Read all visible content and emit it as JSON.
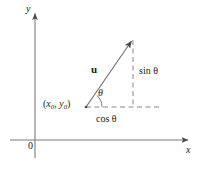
{
  "figure": {
    "colors": {
      "background": "#ffffff",
      "stroke": "#6b6b6b",
      "dashed": "#8a8a8a",
      "text": "#1a1a1a"
    },
    "axes": {
      "y_label": "y",
      "x_label": "x",
      "origin_label": "0"
    },
    "labels": {
      "vector": "u",
      "point_open": "(",
      "point_x": "x",
      "point_x_sub": "0",
      "point_comma": ", ",
      "point_y": "y",
      "point_y_sub": "0",
      "point_close": ")",
      "angle": "θ",
      "horizontal_leg": "cos θ",
      "vertical_leg": "sin θ"
    },
    "geometry": {
      "y_axis_x": 35,
      "y_axis_top": 12,
      "y_axis_bottom": 158,
      "x_axis_y": 140,
      "x_axis_left": 10,
      "x_axis_right": 190,
      "vector_start_x": 86,
      "vector_start_y": 107,
      "vector_end_x": 133,
      "vector_end_y": 39,
      "corner_x": 133,
      "corner_y": 107,
      "dash_h_right": 161,
      "dash_v_top": 40
    }
  }
}
